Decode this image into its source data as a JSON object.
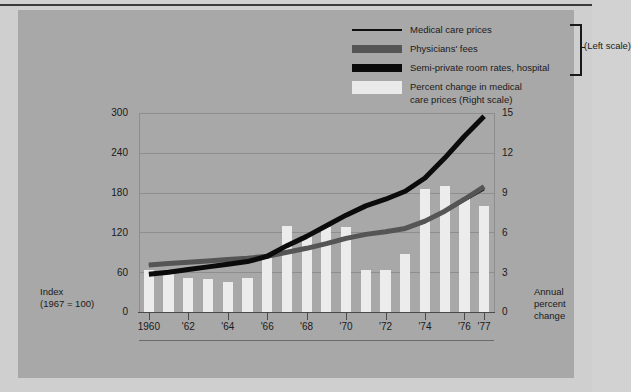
{
  "legend": {
    "items": [
      {
        "label": "Medical care prices",
        "swatch": "line-black"
      },
      {
        "label": "Physicians' fees",
        "swatch": "dark-gray-bar"
      },
      {
        "label": "Semi-private room rates, hospital",
        "swatch": "black-bar"
      },
      {
        "label": "Percent change in medical",
        "label2": "care prices (Right scale)",
        "swatch": "white-bar"
      }
    ],
    "scale_note": "(Left scale)"
  },
  "axes": {
    "left_caption_line1": "Index",
    "left_caption_line2": "(1967 = 100)",
    "right_caption_line1": "Annual",
    "right_caption_line2": "percent change",
    "left_ticks": [
      "0",
      "60",
      "120",
      "180",
      "240",
      "300"
    ],
    "right_ticks": [
      "0",
      "3",
      "6",
      "9",
      "12",
      "15"
    ],
    "x_ticks": [
      "1960",
      "'62",
      "'64",
      "'66",
      "'68",
      "'70",
      "'72",
      "'74",
      "'76",
      "'77"
    ]
  },
  "chart_data": {
    "type": "line",
    "title": "",
    "xlabel": "",
    "ylabel": "Index (1967 = 100)",
    "y2label": "Annual percent change",
    "ylim": [
      0,
      300
    ],
    "y2lim": [
      0,
      15
    ],
    "grid": true,
    "legend_position": "top-right",
    "x": [
      1960,
      1961,
      1962,
      1963,
      1964,
      1965,
      1966,
      1967,
      1968,
      1969,
      1970,
      1971,
      1972,
      1973,
      1974,
      1975,
      1976,
      1977
    ],
    "x_tick_labels": [
      "1960",
      "'62",
      "'64",
      "'66",
      "'68",
      "'70",
      "'72",
      "'74",
      "'76",
      "'77"
    ],
    "series": [
      {
        "name": "Medical care prices",
        "axis": "left",
        "type": "line",
        "color": "#101010",
        "values": [
          71,
          73,
          75,
          77,
          79,
          81,
          84,
          90,
          96,
          103,
          111,
          117,
          121,
          125,
          136,
          151,
          168,
          185
        ]
      },
      {
        "name": "Physicians' fees",
        "axis": "left",
        "type": "line",
        "color": "#555555",
        "values": [
          71,
          73,
          75,
          77,
          79,
          81,
          84,
          90,
          96,
          103,
          111,
          117,
          121,
          126,
          137,
          152,
          170,
          189
        ]
      },
      {
        "name": "Semi-private room rates, hospital",
        "axis": "left",
        "type": "line",
        "color": "#0b0b0b",
        "values": [
          57,
          60,
          64,
          68,
          72,
          76,
          84,
          100,
          114,
          130,
          146,
          160,
          170,
          182,
          202,
          232,
          265,
          295
        ]
      },
      {
        "name": "Percent change in medical care prices",
        "axis": "right",
        "type": "bar",
        "color": "#ececec",
        "values": [
          3.2,
          3.1,
          2.6,
          2.5,
          2.3,
          2.6,
          4.4,
          6.5,
          5.8,
          6.4,
          6.4,
          3.2,
          3.2,
          4.4,
          9.3,
          9.5,
          8.5,
          8.0
        ]
      }
    ]
  }
}
